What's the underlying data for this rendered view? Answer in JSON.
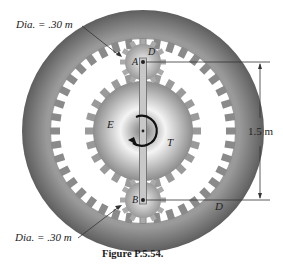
{
  "figure": {
    "caption": "Figure P.5.54.",
    "labels": {
      "dia_top": "Dia. = .30 m",
      "dia_bottom": "Dia. = .30 m",
      "dimension": "1.5 m",
      "gear_a": "A",
      "gear_b": "B",
      "sun_gear": "E",
      "torque": "T",
      "point_d_top": "D",
      "point_d_bottom": "D"
    },
    "colors": {
      "ring": "#6e6e6e",
      "gear_light": "#e8e8e8",
      "gear_dark": "#8a8a8a",
      "line": "#222222"
    }
  }
}
